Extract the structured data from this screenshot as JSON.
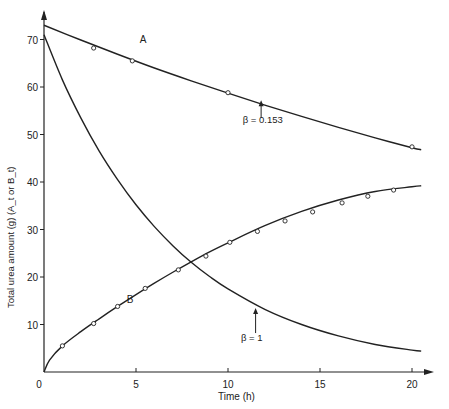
{
  "chart_data": {
    "type": "line",
    "title": "",
    "xlabel": "Time (h)",
    "ylabel": "Total urea amount (g) (A_t or B_t)",
    "xlim": [
      0,
      21
    ],
    "ylim": [
      0,
      75
    ],
    "x_ticks": [
      0,
      5,
      10,
      15,
      20
    ],
    "y_ticks": [
      10,
      20,
      30,
      40,
      50,
      60,
      70
    ],
    "grid": false,
    "series": [
      {
        "name": "A",
        "annotation": "β = 0.153",
        "curve": {
          "x": [
            0,
            2,
            4,
            6,
            8,
            10,
            12,
            14,
            16,
            18,
            20,
            20.5
          ],
          "y": [
            73,
            69.9,
            66.9,
            64.0,
            61.3,
            58.7,
            56.2,
            53.8,
            51.5,
            49.3,
            47.2,
            46.8
          ]
        },
        "markers": {
          "x": [
            2.7,
            4.8,
            10,
            20
          ],
          "y": [
            68.2,
            65.5,
            58.8,
            47.4
          ]
        }
      },
      {
        "name": "β = 1",
        "annotation": "β = 1",
        "curve": {
          "x": [
            0,
            1,
            2,
            3,
            4,
            5,
            6,
            7,
            8,
            9,
            10,
            12,
            14,
            16,
            18,
            20,
            20.5
          ],
          "y": [
            71,
            61.5,
            53.5,
            46.5,
            40.5,
            35.2,
            30.6,
            26.6,
            23.1,
            20.1,
            17.5,
            13.2,
            10.0,
            7.6,
            5.8,
            4.6,
            4.4
          ]
        },
        "markers": {
          "x": [],
          "y": []
        }
      },
      {
        "name": "B",
        "annotation": "",
        "curve": {
          "x": [
            0,
            0.3,
            1,
            2,
            3,
            4,
            5,
            6,
            7,
            8,
            9,
            10,
            12,
            14,
            16,
            18,
            20,
            20.5
          ],
          "y": [
            0,
            2.5,
            5.5,
            8.5,
            11.2,
            13.8,
            16.3,
            18.7,
            21.0,
            23.2,
            25.3,
            27.2,
            30.8,
            33.8,
            36.2,
            38.0,
            39.0,
            39.2
          ]
        },
        "markers": {
          "x": [
            1,
            2.7,
            4.0,
            5.5,
            7.3,
            8.8,
            10.1,
            11.6,
            13.1,
            14.6,
            16.2,
            17.6,
            19.0
          ],
          "y": [
            5.5,
            10.2,
            13.8,
            17.6,
            21.5,
            24.4,
            27.3,
            29.6,
            31.8,
            33.7,
            35.6,
            37.0,
            38.3
          ]
        }
      }
    ],
    "labels": {
      "A": {
        "text": "A",
        "x": 5.2,
        "y": 69.3
      },
      "B": {
        "text": "B",
        "x": 4.5,
        "y": 14.5
      },
      "beta_a": {
        "text": "β = 0.153",
        "x": 10.8,
        "y": 52.5,
        "arrow_x": 11.8,
        "arrow_from": 53.5,
        "arrow_to": 57.2
      },
      "beta_b": {
        "text": "β = 1",
        "x": 10.7,
        "y": 6.6,
        "arrow_x": 11.5,
        "arrow_from": 8.2,
        "arrow_to": 13.5
      }
    },
    "legend": null
  }
}
